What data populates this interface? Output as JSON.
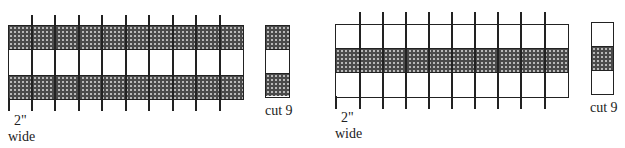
{
  "figures": [
    {
      "id": "left",
      "description": "Strip set: dark / light / dark, cut into 2-inch segments",
      "bands": [
        "dark",
        "light",
        "dark"
      ],
      "segment_width_label": "2\"",
      "segment_width_label2": "wide",
      "piece_label": "cut 9",
      "cut_lines": 10
    },
    {
      "id": "right",
      "description": "Strip set: light / dark / light, cut into 2-inch segments",
      "bands": [
        "light",
        "dark",
        "light"
      ],
      "segment_width_label": "2\"",
      "segment_width_label2": "wide",
      "piece_label": "cut 9",
      "cut_lines": 10
    }
  ],
  "colors": {
    "line": "#222222",
    "fabric_dark": "#4a4a4a",
    "fabric_light": "#ffffff"
  }
}
